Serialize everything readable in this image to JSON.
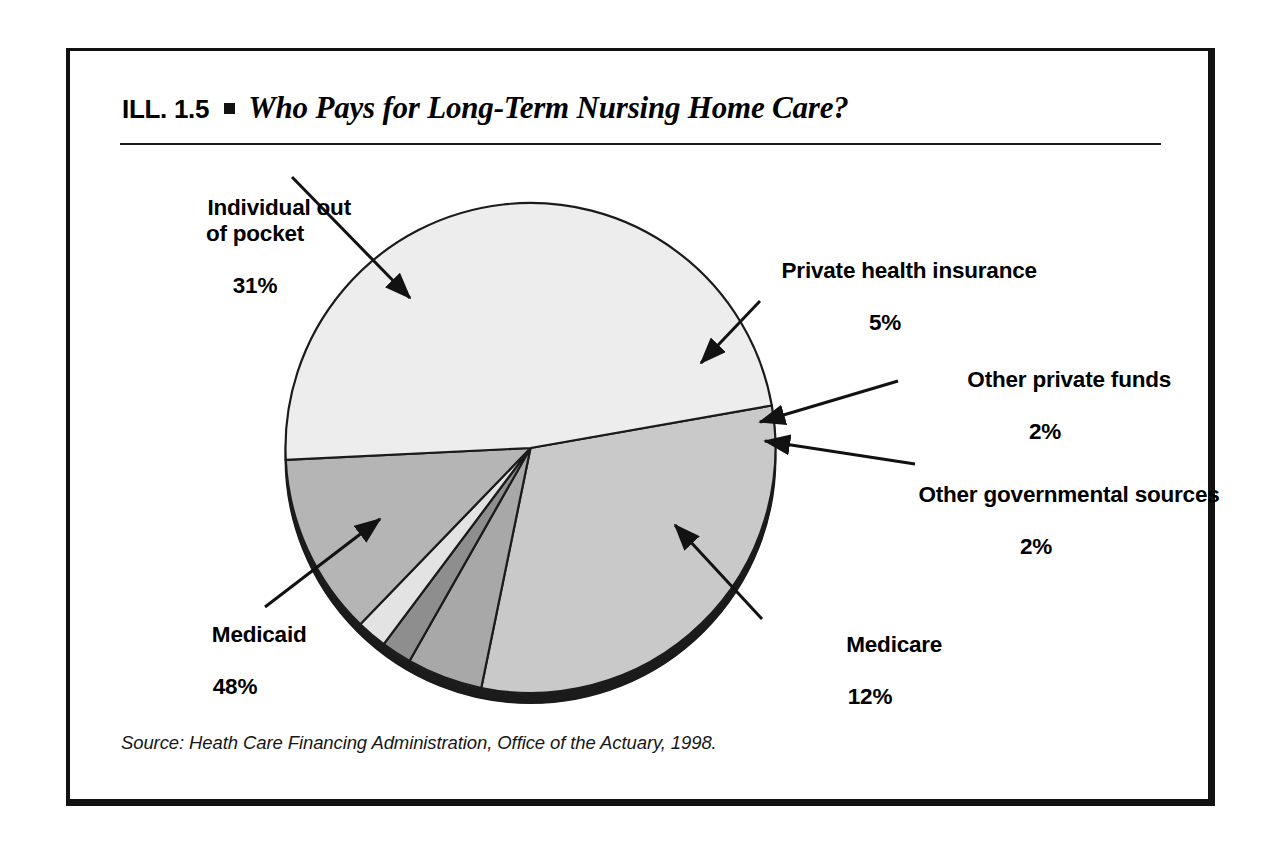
{
  "figure": {
    "number_label": "ILL. 1.5",
    "bullet": "square-bullet",
    "title": "Who Pays for Long-Term Nursing Home Care?",
    "source": "Source: Heath Care Financing Administration, Office of the Actuary, 1998."
  },
  "callouts": {
    "individual": {
      "name": "Individual out\nof pocket",
      "pct": "31%"
    },
    "private_health": {
      "name": "Private health insurance",
      "pct": "5%"
    },
    "other_private": {
      "name": "Other private funds",
      "pct": "2%"
    },
    "other_gov": {
      "name": "Other governmental sources",
      "pct": "2%"
    },
    "medicaid": {
      "name": "Medicaid",
      "pct": "48%"
    },
    "medicare": {
      "name": "Medicare",
      "pct": "12%"
    }
  },
  "chart_data": {
    "type": "pie",
    "title": "Who Pays for Long-Term Nursing Home Care?",
    "categories": [
      "Individual out of pocket",
      "Private health insurance",
      "Other private funds",
      "Other governmental sources",
      "Medicare",
      "Medicaid"
    ],
    "values": [
      31,
      5,
      2,
      2,
      12,
      48
    ],
    "units": "percent",
    "total": 100,
    "labels": [
      "31%",
      "5%",
      "2%",
      "2%",
      "12%",
      "48%"
    ],
    "colors": [
      "#c9c9c9",
      "#a8a8a8",
      "#8e8e8e",
      "#e3e3e3",
      "#b5b5b5",
      "#ededed"
    ],
    "legend": "none",
    "annotations": "leader lines with arrowheads from each label to its slice",
    "style": {
      "three_d_rim": true,
      "rim_color": "#1b1b1b",
      "outline_color": "#1b1b1b",
      "start_angle_deg": -10,
      "direction": "clockwise"
    },
    "source": "Heath Care Financing Administration, Office of the Actuary, 1998."
  }
}
